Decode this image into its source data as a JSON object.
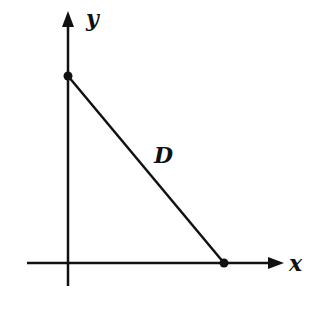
{
  "diagram": {
    "labels": {
      "x_axis": "x",
      "y_axis": "y",
      "segment": "D"
    },
    "points": [
      {
        "name": "y-intercept",
        "on_axis": "y"
      },
      {
        "name": "x-intercept",
        "on_axis": "x"
      }
    ],
    "colors": {
      "stroke": "#111111",
      "background": "#ffffff"
    }
  }
}
